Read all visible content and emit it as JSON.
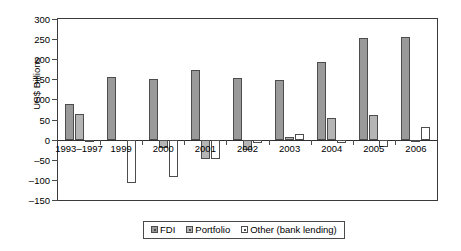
{
  "chart_data": {
    "type": "bar",
    "title": "",
    "xlabel": "",
    "ylabel": "US$ Billions",
    "ylim": [
      -150,
      300
    ],
    "yticks": [
      300,
      250,
      200,
      150,
      100,
      50,
      0,
      -50,
      -100,
      -150
    ],
    "ytick_labels": [
      "300",
      "250",
      "200",
      "150",
      "100",
      "50",
      "0",
      "–50",
      "–100",
      "–150"
    ],
    "grid": false,
    "legend_position": "bottom",
    "categories": [
      "1993–1997",
      "1999",
      "2000",
      "2001",
      "2002",
      "2003",
      "2004",
      "2005",
      "2006"
    ],
    "series": [
      {
        "name": "FDI",
        "color": "#9a9a9a",
        "values": [
          88,
          156,
          150,
          172,
          154,
          148,
          193,
          252,
          255
        ]
      },
      {
        "name": "Portfolio",
        "color": "#b5b5b5",
        "values": [
          64,
          0,
          -20,
          -48,
          -26,
          7,
          54,
          62,
          -5
        ]
      },
      {
        "name": "Other (bank lending)",
        "color": "#ffffff",
        "values": [
          -3,
          -107,
          -92,
          -48,
          -9,
          13,
          -8,
          -18,
          32
        ]
      }
    ]
  },
  "legend": {
    "items": [
      {
        "label": "FDI",
        "swatch": "fdi"
      },
      {
        "label": "Portfolio",
        "swatch": "portfolio"
      },
      {
        "label": "Other (bank lending)",
        "swatch": "other"
      }
    ]
  }
}
